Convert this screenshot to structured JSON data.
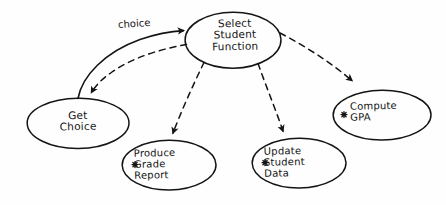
{
  "diagram": {
    "style": "hand-drawn sketch",
    "background_color": "#fefefe",
    "ink_color": "#141414",
    "nodes": [
      {
        "id": "select-student-function",
        "label": "Select\nStudent\nFunction",
        "shape": "ellipse",
        "asterisk": false,
        "cx": 233,
        "cy": 40,
        "rx": 48,
        "ry": 28
      },
      {
        "id": "get-choice",
        "label": "Get\nChoice",
        "shape": "ellipse",
        "asterisk": false,
        "cx": 78,
        "cy": 123,
        "rx": 51,
        "ry": 25
      },
      {
        "id": "produce-grade-report",
        "label": "Produce\nGrade\nReport",
        "shape": "ellipse",
        "asterisk": true,
        "cx": 169,
        "cy": 165,
        "rx": 47,
        "ry": 25
      },
      {
        "id": "update-student-data",
        "label": "Update\nStudent\nData",
        "shape": "ellipse",
        "asterisk": true,
        "cx": 299,
        "cy": 163,
        "rx": 47,
        "ry": 25
      },
      {
        "id": "compute-gpa",
        "label": "Compute\nGPA",
        "shape": "ellipse",
        "asterisk": true,
        "cx": 382,
        "cy": 115,
        "rx": 49,
        "ry": 25
      }
    ],
    "edges": [
      {
        "id": "edge-choice",
        "from": "get-choice",
        "to": "select-student-function",
        "style": "solid",
        "label": "choice",
        "arrowhead": "filled"
      },
      {
        "id": "edge-select-to-get",
        "from": "select-student-function",
        "to": "get-choice",
        "style": "dashed",
        "label": "",
        "arrowhead": "filled"
      },
      {
        "id": "edge-select-to-produce",
        "from": "select-student-function",
        "to": "produce-grade-report",
        "style": "dashed",
        "label": "",
        "arrowhead": "filled"
      },
      {
        "id": "edge-select-to-update",
        "from": "select-student-function",
        "to": "update-student-data",
        "style": "dashed",
        "label": "",
        "arrowhead": "filled"
      },
      {
        "id": "edge-select-to-gpa",
        "from": "select-student-function",
        "to": "compute-gpa",
        "style": "dashed",
        "label": "",
        "arrowhead": "filled"
      }
    ]
  }
}
